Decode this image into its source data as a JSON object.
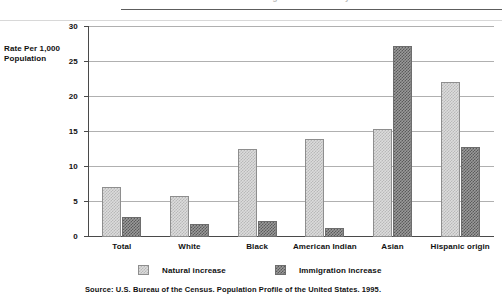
{
  "title_strip": {
    "ghost_text": "Natural Increase and Immigration Increase by Race"
  },
  "chart_data": {
    "type": "bar",
    "title": "",
    "xlabel": "",
    "ylabel": "Rate Per 1,000 Population",
    "ylim": [
      0,
      30
    ],
    "yticks": [
      0,
      5,
      10,
      15,
      20,
      25,
      30
    ],
    "ytick_labels": [
      "0",
      "5",
      "10",
      "15",
      "20",
      "25",
      "30"
    ],
    "grid": true,
    "legend_position": "bottom",
    "categories": [
      "Total",
      "White",
      "Black",
      "American Indian",
      "Asian",
      "Hispanic origin"
    ],
    "series": [
      {
        "name": "Natural increase",
        "color": "#dcdcdc",
        "values": [
          7.2,
          5.8,
          12.6,
          14.0,
          15.4,
          22.2
        ]
      },
      {
        "name": "Immigration increase",
        "color": "#9a9a9a",
        "values": [
          2.9,
          1.9,
          2.3,
          1.3,
          27.3,
          12.8
        ]
      }
    ]
  },
  "source": {
    "note": "Source: U.S. Bureau of the Census. Population Profile of the United States. 1995."
  }
}
